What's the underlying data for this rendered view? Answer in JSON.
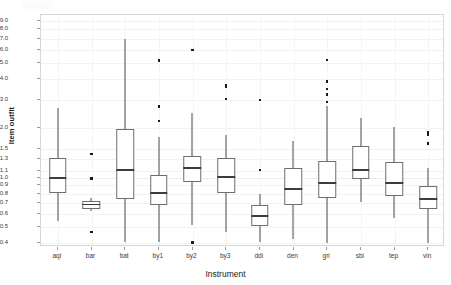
{
  "chart_data": {
    "type": "box",
    "title": "",
    "xlabel": "Instrument",
    "ylabel": "Item outfit",
    "yscale": "log",
    "ylim": [
      0.38,
      9.8
    ],
    "grid": true,
    "legend": false,
    "categories": [
      "aqi",
      "bar",
      "bat",
      "by1",
      "by2",
      "by3",
      "ddi",
      "den",
      "gri",
      "sbi",
      "tep",
      "vin"
    ],
    "ytick_values": [
      0.4,
      0.5,
      0.6,
      0.7,
      0.8,
      0.9,
      1.0,
      1.1,
      1.3,
      1.5,
      2.0,
      3.0,
      4.0,
      5.0,
      6.0,
      7.0,
      8.0,
      9.0
    ],
    "ytick_labels": [
      "0.4",
      "0.5",
      "0.6",
      "0.7",
      "0.8",
      "0.9",
      "1.0",
      "1.1",
      "1.3",
      "1.5",
      "2.0",
      "3.0",
      "4.0",
      "5.0",
      "6.0",
      "7.0",
      "8.0",
      "9.0"
    ],
    "boxes": [
      {
        "label": "aqi",
        "whisker_low": 0.55,
        "q1": 0.81,
        "median": 1.0,
        "q3": 1.32,
        "whisker_high": 2.65,
        "outliers": []
      },
      {
        "label": "bar",
        "whisker_low": 0.63,
        "q1": 0.645,
        "median": 0.69,
        "q3": 0.725,
        "whisker_high": 0.75,
        "outliers": [
          1.4,
          0.99,
          0.47
        ]
      },
      {
        "label": "bat",
        "whisker_low": 0.41,
        "q1": 0.745,
        "median": 1.12,
        "q3": 1.98,
        "whisker_high": 7.05,
        "outliers": []
      },
      {
        "label": "by1",
        "whisker_low": 0.41,
        "q1": 0.68,
        "median": 0.81,
        "q3": 1.04,
        "whisker_high": 1.77,
        "outliers": [
          5.2,
          2.72,
          2.22
        ]
      },
      {
        "label": "by2",
        "whisker_low": 0.52,
        "q1": 0.94,
        "median": 1.15,
        "q3": 1.36,
        "whisker_high": 2.5,
        "outliers": [
          6.0,
          0.405
        ]
      },
      {
        "label": "by3",
        "whisker_low": 0.47,
        "q1": 0.81,
        "median": 1.01,
        "q3": 1.32,
        "whisker_high": 1.82,
        "outliers": [
          3.68,
          3.58,
          3.02
        ]
      },
      {
        "label": "ddi",
        "whisker_low": 0.41,
        "q1": 0.51,
        "median": 0.585,
        "q3": 0.685,
        "whisker_high": 0.8,
        "outliers": [
          2.98,
          1.12
        ]
      },
      {
        "label": "den",
        "whisker_low": 0.425,
        "q1": 0.685,
        "median": 0.855,
        "q3": 1.15,
        "whisker_high": 1.68,
        "outliers": []
      },
      {
        "label": "gri",
        "whisker_low": 0.4,
        "q1": 0.755,
        "median": 0.93,
        "q3": 1.27,
        "whisker_high": 2.72,
        "outliers": [
          5.22,
          3.85,
          3.48,
          3.22,
          2.9
        ]
      },
      {
        "label": "sbi",
        "whisker_low": 0.71,
        "q1": 0.99,
        "median": 1.12,
        "q3": 1.56,
        "whisker_high": 2.3,
        "outliers": []
      },
      {
        "label": "tep",
        "whisker_low": 0.57,
        "q1": 0.78,
        "median": 0.93,
        "q3": 1.25,
        "whisker_high": 2.03,
        "outliers": []
      },
      {
        "label": "vin",
        "whisker_low": 0.4,
        "q1": 0.645,
        "median": 0.745,
        "q3": 0.89,
        "whisker_high": 1.15,
        "outliers": [
          1.9,
          1.84,
          1.62
        ]
      }
    ]
  },
  "style": {
    "panel_border": "#d7d7d7",
    "gridline": "#f0f0f0",
    "box_stroke": "#6e6e6e",
    "median_stroke": "#3d3d3d",
    "outlier_fill": "#1a1a1a",
    "tick_text": "#3a3a3a",
    "axis_title": "#1a1a1a",
    "background": "#ffffff"
  }
}
